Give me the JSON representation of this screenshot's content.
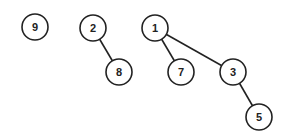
{
  "diagram": {
    "type": "forest",
    "node_radius": 13,
    "nodes": [
      {
        "id": "n9",
        "label": "9",
        "x": 35,
        "y": 27
      },
      {
        "id": "n2",
        "label": "2",
        "x": 93,
        "y": 28
      },
      {
        "id": "n8",
        "label": "8",
        "x": 119,
        "y": 72
      },
      {
        "id": "n1",
        "label": "1",
        "x": 155,
        "y": 28
      },
      {
        "id": "n7",
        "label": "7",
        "x": 181,
        "y": 72
      },
      {
        "id": "n3",
        "label": "3",
        "x": 233,
        "y": 72
      },
      {
        "id": "n5",
        "label": "5",
        "x": 259,
        "y": 117
      }
    ],
    "edges": [
      {
        "from": "n2",
        "to": "n8"
      },
      {
        "from": "n1",
        "to": "n7"
      },
      {
        "from": "n1",
        "to": "n3"
      },
      {
        "from": "n3",
        "to": "n5"
      }
    ]
  }
}
